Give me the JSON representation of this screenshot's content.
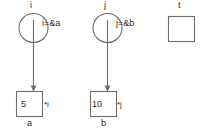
{
  "diagram": {
    "type": "pointer-memory-diagram",
    "background_color": "#ffffff",
    "stroke_color": "#6e6e6e",
    "text_color": "#2b2b2b",
    "nodes": [
      {
        "id": "i",
        "kind": "pointer-variable",
        "name": "i",
        "expression": "i=&a",
        "shape": "circle",
        "target": {
          "id": "a",
          "kind": "value-box",
          "value": "5",
          "deref_label": "*i",
          "name": "a",
          "shape": "square"
        }
      },
      {
        "id": "j",
        "kind": "pointer-variable",
        "name": "j",
        "expression": "j=&b",
        "shape": "circle",
        "target": {
          "id": "b",
          "kind": "value-box",
          "value": "10",
          "deref_label": "*j",
          "name": "b",
          "shape": "square"
        }
      },
      {
        "id": "t",
        "kind": "empty-box",
        "name": "t",
        "value": "",
        "shape": "square"
      }
    ],
    "edges": [
      {
        "from": "i",
        "to": "a",
        "style": "arrow-down"
      },
      {
        "from": "j",
        "to": "b",
        "style": "arrow-down"
      }
    ]
  }
}
